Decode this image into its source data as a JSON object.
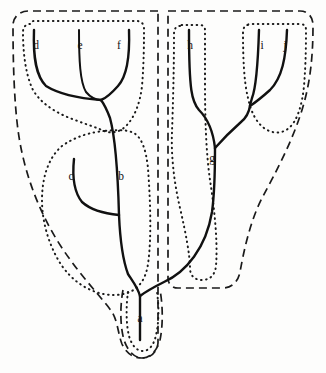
{
  "figure": {
    "type": "cladogram-diagram",
    "background_color": "#fdfdfc",
    "line_color": "#111111",
    "caption": "",
    "tip_labels": [
      {
        "id": "a",
        "label": "a",
        "x": 140,
        "y": 318,
        "role": "root-stem"
      },
      {
        "id": "b",
        "label": "b",
        "x": 121,
        "y": 176,
        "role": "internal-branch"
      },
      {
        "id": "c",
        "label": "c",
        "x": 71,
        "y": 176,
        "role": "terminal-branch"
      },
      {
        "id": "d",
        "label": "d",
        "x": 36,
        "y": 45,
        "role": "terminal-branch"
      },
      {
        "id": "e",
        "label": "e",
        "x": 80,
        "y": 45,
        "role": "terminal-branch"
      },
      {
        "id": "f",
        "label": "f",
        "x": 119,
        "y": 45,
        "role": "terminal-branch"
      },
      {
        "id": "g",
        "label": "g",
        "x": 212,
        "y": 158,
        "role": "internal-branch"
      },
      {
        "id": "h",
        "label": "h",
        "x": 190,
        "y": 45,
        "role": "terminal-branch"
      },
      {
        "id": "i",
        "label": "i",
        "x": 262,
        "y": 45,
        "role": "terminal-branch"
      },
      {
        "id": "j",
        "label": "j",
        "x": 285,
        "y": 45,
        "role": "terminal-branch"
      }
    ],
    "groupings": {
      "dashed_outlines": 3,
      "dotted_outlines": 5,
      "dashed_description": "outer dashed boundaries enclose the two major clades and the root stem",
      "dotted_description": "inner dotted boundaries enclose nested subgroups"
    },
    "branch_paths": {
      "root_stem": "M 140 340 L 140 296",
      "left_clade_stem": "M 140 296 C 138 288 134 283 128 274 C 122 258 120 238 119 215",
      "b_to_def": "M 119 215 C 118 178 116 140 110 118 C 107 110 104 104 101 100",
      "c_branch": "M 74 159 C 72 178 74 192 82 202 C 93 212 108 214 119 215",
      "d_branch": "M 34 30 C 33 58 36 76 46 86 C 62 96 88 99 101 100",
      "e_branch": "M 79 30 C 79 60 80 82 86 92 C 91 98 97 100 101 100",
      "f_branch": "M 129 30 C 130 58 127 76 118 86 C 110 95 104 99 101 100",
      "right_clade_stem": "M 140 296 C 148 290 156 286 164 282 C 186 272 206 248 212 212 C 215 190 215 170 215 148",
      "g_to_h": "M 215 148 C 213 130 207 118 199 110 C 192 102 189 92 189 30",
      "g_node_to_ij": "M 215 148 C 222 140 232 130 241 122 C 246 118 249 112 250 106",
      "i_branch": "M 259 30 C 258 62 256 88 252 98 C 251 102 250 104 250 106",
      "j_branch": "M 287 30 C 286 58 282 78 270 90 C 260 99 253 104 250 106"
    }
  }
}
